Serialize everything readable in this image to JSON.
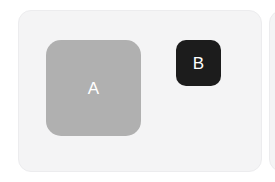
{
  "canvas": {
    "width": 275,
    "height": 182,
    "background_color": "#ffffff"
  },
  "cards": {
    "primary": {
      "name": "primary-card",
      "fill_color": "#f4f4f5",
      "border_color": "#ececee",
      "swatches": [
        {
          "label": "A",
          "name": "swatch-a",
          "fill_color": "#b0b0b0",
          "text_color": "#ffffff",
          "size": "large"
        },
        {
          "label": "B",
          "name": "swatch-b",
          "fill_color": "#1c1c1c",
          "text_color": "#ffffff",
          "size": "small"
        }
      ]
    },
    "secondary": {
      "name": "secondary-card",
      "fill_color": "#f4f4f5",
      "border_color": "#ececee",
      "clipped": "true"
    }
  }
}
